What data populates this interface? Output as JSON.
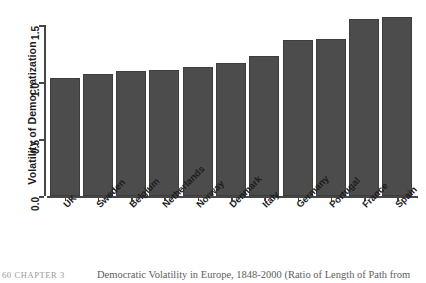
{
  "chart_data": {
    "type": "bar",
    "title": "",
    "xlabel": "",
    "ylabel": "Volatility of Democratization",
    "categories": [
      "UK",
      "Sweden",
      "Belgium",
      "Netherlands",
      "Norway",
      "Denmark",
      "Italy",
      "Germany",
      "Portugal",
      "France",
      "Spain"
    ],
    "values": [
      1.04,
      1.07,
      1.1,
      1.11,
      1.13,
      1.17,
      1.23,
      1.37,
      1.38,
      1.56,
      1.57
    ],
    "ylim": [
      0,
      1.6
    ],
    "ytick_labels": [
      "0.0",
      "0.5",
      "1.0",
      "1.5"
    ],
    "ytick_values": [
      0.0,
      0.5,
      1.0,
      1.5
    ],
    "grid": false,
    "legend": "none",
    "bar_color": "#4c4c4c",
    "axis_color": "#464646"
  },
  "caption": {
    "running_head": "60 CHAPTER 3",
    "text": "Democratic Volatility in Europe, 1848-2000 (Ratio of Length of Path from"
  }
}
